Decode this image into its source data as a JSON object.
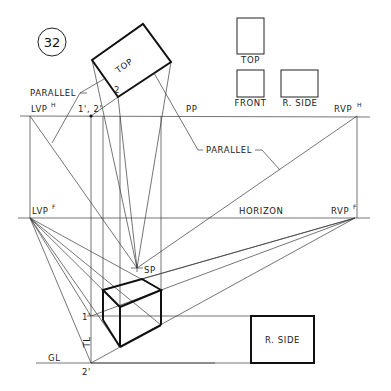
{
  "figure": {
    "number": "32"
  },
  "views": {
    "top_label": "TOP",
    "front_label": "FRONT",
    "side_label": "R. SIDE"
  },
  "plan": {
    "top_label": "TOP",
    "corner_label": "2"
  },
  "labels": {
    "parallel_left": "PARALLEL",
    "parallel_right": "PARALLEL",
    "picture_plane": "PP",
    "horizon": "HORIZON",
    "ground_line": "GL",
    "station_point": "SP",
    "true_length": "TL",
    "point_12": "1', 2'",
    "point_1": "1'",
    "point_2": "2'",
    "lvp_h": "LVP",
    "lvp_h_sup": "H",
    "rvp_h": "RVP",
    "rvp_h_sup": "H",
    "lvp_f": "LVP",
    "lvp_f_sup": "F",
    "rvp_f": "RVP",
    "rvp_f_sup": "F",
    "side_view": "R. SIDE"
  },
  "colors": {
    "ink": "#111111",
    "background": "#ffffff"
  }
}
